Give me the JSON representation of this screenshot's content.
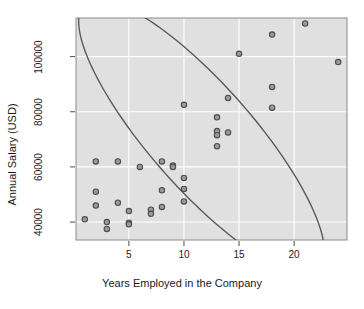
{
  "chart_data": {
    "type": "scatter",
    "title": "",
    "xlabel": "Years Employed in the Company",
    "ylabel": "Annual Salary (USD)",
    "xlim": [
      0.2,
      24.8
    ],
    "ylim": [
      33500,
      114000
    ],
    "xticks": [
      5,
      10,
      15,
      20
    ],
    "xtick_labels": [
      "5",
      "10",
      "15",
      "20"
    ],
    "yticks": [
      40000,
      60000,
      80000,
      100000
    ],
    "ytick_labels": [
      "40000",
      "60000",
      "80000",
      "100000"
    ],
    "grid": true,
    "grid_color": "#ffffff",
    "panel_background": "#e0e0e0",
    "point_fill": "#9a9a9a",
    "point_stroke": "#4d4d4d",
    "ellipse_color": "#5a5a5a",
    "legend": null,
    "x": [
      1,
      2,
      2,
      2,
      3,
      3,
      4,
      4,
      5,
      5,
      5,
      6,
      7,
      7,
      8,
      8,
      8,
      9,
      9,
      10,
      10,
      10,
      10,
      13,
      13,
      13,
      13,
      14,
      14,
      15,
      18,
      18,
      18,
      21,
      24
    ],
    "y": [
      41000,
      62000,
      51000,
      46000,
      40000,
      37500,
      62000,
      47000,
      44000,
      39800,
      39200,
      60000,
      44500,
      43000,
      62000,
      51500,
      45500,
      60500,
      60000,
      82500,
      56000,
      52000,
      47500,
      78000,
      73000,
      71500,
      67500,
      85000,
      72500,
      101000,
      108000,
      89000,
      81500,
      112000,
      98000
    ],
    "ellipse": {
      "center_x": 11.6,
      "center_y": 71000,
      "semi_major": 13.9,
      "semi_minor": 4.0,
      "angle_deg": -38.5,
      "description": "95% confidence ellipse"
    },
    "n_points": 35
  }
}
